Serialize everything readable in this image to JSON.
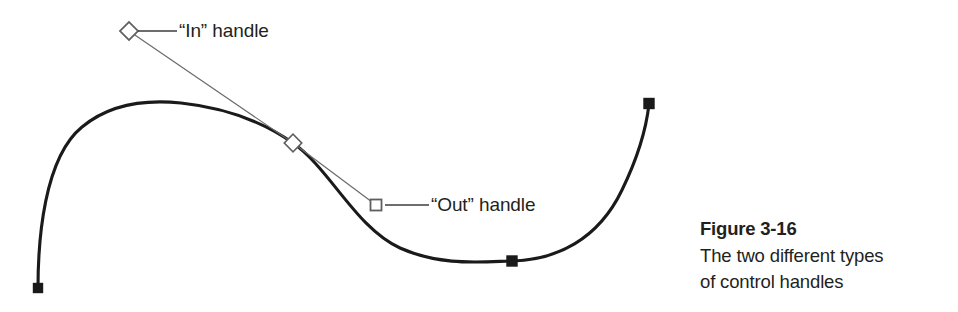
{
  "figure": {
    "kind": "vector-path-diagram",
    "background_color": "#ffffff",
    "ink_color": "#1a1a1a",
    "handle_stroke_color": "#6e6e6e",
    "leader_line_color": "#4d4d4d",
    "annotations": [
      {
        "id": "in-handle",
        "label": "“In” handle",
        "handle_type": "diamond",
        "handle_fill": "none",
        "handle_point": [
          129,
          31
        ]
      },
      {
        "id": "out-handle",
        "label": "“Out” handle",
        "handle_type": "square",
        "handle_fill": "none",
        "handle_point": [
          376,
          205
        ]
      }
    ],
    "anchor_points": [
      {
        "id": "anchor-start",
        "shape": "filled-square",
        "point": [
          38,
          288
        ]
      },
      {
        "id": "anchor-middle",
        "shape": "diamond",
        "point": [
          293,
          143
        ]
      },
      {
        "id": "anchor-bottom",
        "shape": "filled-square",
        "point": [
          512,
          261
        ]
      },
      {
        "id": "anchor-end",
        "shape": "filled-square",
        "point": [
          649,
          103
        ]
      }
    ],
    "caption": {
      "title": "Figure 3-16",
      "lines": [
        "The two different types",
        "of control handles"
      ]
    }
  }
}
